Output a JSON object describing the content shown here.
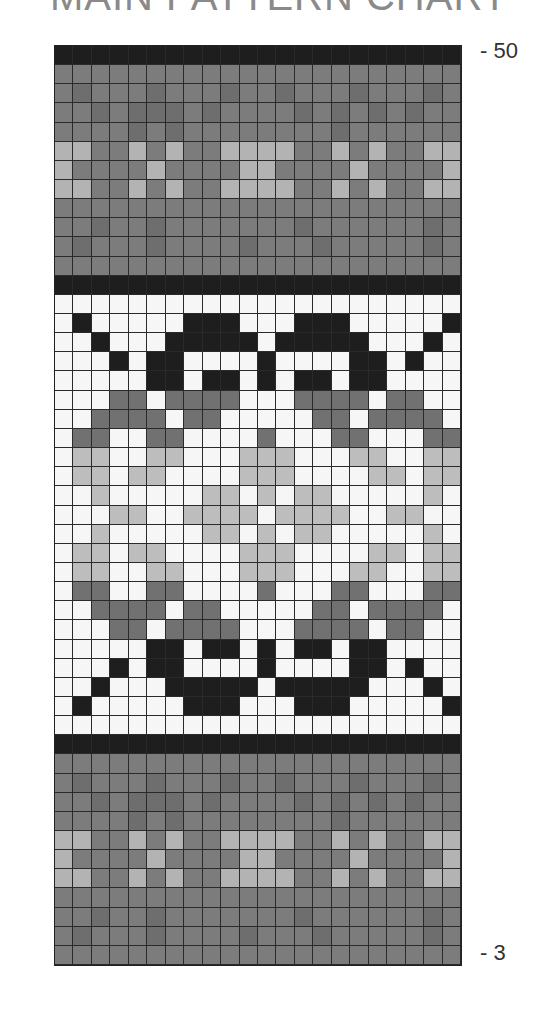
{
  "title": "MAIN PATTERN CHART",
  "row_labels": {
    "top": "- 50",
    "bottom": "- 3"
  },
  "chart_data": {
    "type": "table",
    "title": "MAIN PATTERN CHART",
    "columns": 22,
    "rows": 48,
    "row_range": [
      3,
      50
    ],
    "row_order": "top-to-bottom, first row = 50, last row = 3",
    "legend": {
      "K": "#1e1e1e",
      "G": "#7c7c7c",
      "D": "#6e6e6e",
      "L": "#b3b3b3",
      "W": "#f6f6f6",
      "M": "#717171",
      "P": "#bdbdbd"
    },
    "grid": [
      "KKKKKKKKKKKKKKKKKKKKKK",
      "GGGGGGGGGGGGGGGGGGGGGG",
      "GDGGGDGGGDGGDGGGDGGGDG",
      "GGDGDDDGDGGGGDGDGDGDGG",
      "GGGGDGDGGGGGGGGDGGGGGG",
      "LLGGLGLGGLLLLGGLGLGGLL",
      "LGGGGLGGGGLLGGGGLGGGGL",
      "LLGGLGLGGLLLLGGLGLGGLL",
      "GGGGGGGGGGGGGGGGGGGGGG",
      "GGDGGDGGGGGGGDGGGGGGDG",
      "GDGGGDGGGGDGGGDGGGGGDG",
      "GGGGGGGGGGGGGGGGGGGGGG",
      "KKKKKKKKKKKKKKKKKKKKKK",
      "WWWWWWWWWWWWWWWWWWWWWW",
      "WKWWWWWKKKWWWKKKWWWWWK",
      "WWKWWWKKKKKWKKKKKWWWKW",
      "WWWKWKKWWWWKWWWWKKWKWW",
      "WWWWWKKWKKWKWKKWKKWWWW",
      "WWWMMWMMMMWWWMMMMWMMWW",
      "WWMMMMWMMWWWWWMMWMMMMW",
      "WMMWWMMWWWWMWWWMMWWWMM",
      "WPPWWPPWWWPPPWWWPPWWPP",
      "WPPWPPWWWWPPPWWWWPPWPP",
      "WWPWWWWWPPWPWPPWWWWWPW",
      "WWWPPWWPPPPWPPPPWWPPWW",
      "WWPWWWWWPPWPWPPWWWWWPW",
      "WPPWPPWWWWPPPWWWWPPWPP",
      "WPPWWPPWWWPPPWWWPPWWPP",
      "WMMWWMMWWWWMWWWMMWWWMM",
      "WWMMMMWMMWWWWWMMWMMMMW",
      "WWWMMWMMMMWWWMMMMWMMWW",
      "WWWWWKKWKKWKWKKWKKWWWW",
      "WWWKWKKWWWWKWWWWKKWKWW",
      "WWKWWWKKKKKWKKKKKWWWKW",
      "WKWWWWWKKKWWWKKKWWWWWK",
      "WWWWWWWWWWWWWWWWWWWWWW",
      "KKKKKKKKKKKKKKKKKKKKKK",
      "GGGGGGGGGGGGGGGGGGGGGG",
      "GDGGGDGGGDGGDGGGDGGGDG",
      "GGDGDDDGDGGGGDGDGDGDGG",
      "GGGGDGDGGGGGGGGDGGGGGG",
      "LLGGLGLGGLLLLGGLGLGGLL",
      "LGGGGLGGGGLLGGGGLGGGGL",
      "LLGGLGLGGLLLLGGLGLGGLL",
      "GGGGGGGGGGGGGGGGGGGGGG",
      "GGDGGDGGGGGGGDGGGGGGDG",
      "GDGGGDGGGGDGGGDGGGGGDG",
      "GGGGGGGGGGGGGGGGGGGGGG"
    ]
  }
}
